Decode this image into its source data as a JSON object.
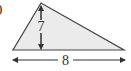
{
  "figure": {
    "type": "triangle",
    "fill_color": "#ebebeb",
    "stroke_color": "#444444",
    "height_label": "7",
    "base_label": "8",
    "prefix_glyph": ")"
  }
}
